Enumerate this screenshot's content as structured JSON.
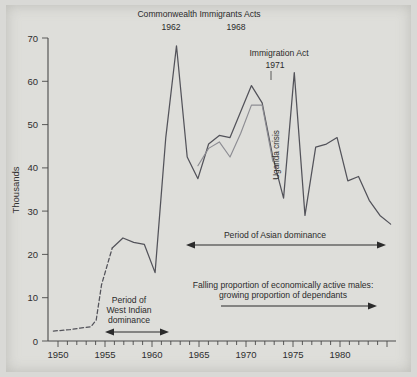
{
  "figure": {
    "background_color": "#dededa",
    "ink_color": "#4a4a4a",
    "secondary_series_color": "#8d8d93"
  },
  "chart_data": {
    "type": "line",
    "title": "",
    "xlabel": "",
    "ylabel": "Thousands",
    "xlim": [
      1949,
      1981.5
    ],
    "ylim": [
      0,
      70
    ],
    "ytick_step": 10,
    "xtick_step": 1,
    "xtick_label_step": 5,
    "grid": false,
    "legend": "none",
    "ytick_labels": [
      "0",
      "10",
      "20",
      "30",
      "40",
      "50",
      "60",
      "70"
    ],
    "ytick_values": [
      0,
      10,
      20,
      30,
      40,
      50,
      60,
      70
    ],
    "xtick_labels": [
      "1950",
      "1955",
      "1960",
      "1965",
      "1970",
      "1975",
      "1980"
    ],
    "xtick_values": [
      1950,
      1955,
      1960,
      1965,
      1970,
      1975,
      1980
    ],
    "series": [
      {
        "name": "Total immigration (New Commonwealth)",
        "style": "solid-with-dashed-lead",
        "color": "#53535a",
        "dashed_until_year": 1955,
        "x": [
          1949.5,
          1951,
          1952,
          1953,
          1953.5,
          1954,
          1955,
          1956,
          1957,
          1958,
          1959,
          1960,
          1961,
          1962,
          1963,
          1964,
          1965,
          1966,
          1967,
          1968,
          1969,
          1970,
          1971,
          1972,
          1973,
          1974,
          1975,
          1976,
          1977,
          1978,
          1979,
          1980,
          1981
        ],
        "y": [
          2.3,
          2.6,
          3.0,
          3.3,
          4.8,
          13.0,
          21.5,
          23.8,
          22.8,
          22.3,
          15.8,
          47.0,
          68.2,
          42.5,
          37.5,
          45.5,
          47.5,
          47.0,
          53.0,
          59.0,
          55.0,
          42.5,
          33.0,
          62.0,
          29.0,
          44.8,
          45.5,
          47.0,
          37.0,
          38.0,
          32.5,
          29.0,
          27.0
        ]
      },
      {
        "name": "Secondary (dependants) series",
        "style": "solid",
        "color": "#8d8d93",
        "x": [
          1963,
          1964,
          1965,
          1966,
          1967,
          1968,
          1969,
          1970
        ],
        "y": [
          40.5,
          44.5,
          46.0,
          42.5,
          48.0,
          54.5,
          54.5,
          41.5
        ]
      }
    ],
    "annotations": [
      {
        "name": "commonwealth-immigrants-acts",
        "text": "Commonwealth Immigrants Acts",
        "type": "label",
        "x": 1965.0,
        "y": 73.5
      },
      {
        "name": "act-year-1962",
        "text": "1962",
        "type": "label-with-leader",
        "x": 1962,
        "y": 70.5
      },
      {
        "name": "act-year-1968",
        "text": "1968",
        "type": "label-with-leader",
        "x": 1967.6,
        "y": 70.5
      },
      {
        "name": "immigration-act",
        "text": "Immigration Act",
        "type": "label",
        "x": 1971.4,
        "y": 67.0
      },
      {
        "name": "immigration-act-year",
        "text": "1971",
        "type": "label-with-leader",
        "x": 1971.2,
        "y": 64.0
      },
      {
        "name": "uganda-crisis",
        "text": "Uganda crisis",
        "type": "rotated-label",
        "rotation": -90,
        "x": 1972.1,
        "y": 44.0
      },
      {
        "name": "period-of-asian-dominance",
        "text": "Period of Asian dominance",
        "type": "double-arrow-span",
        "x_start": 1963.0,
        "x_end": 1981.0,
        "y": 23.5
      },
      {
        "name": "falling-proportion-line-1",
        "text": "Falling proportion of economically active males:",
        "type": "label",
        "x": 1971.5,
        "y": 14.8
      },
      {
        "name": "falling-proportion-line-2",
        "text": "growing proportion of dependants",
        "type": "label",
        "x": 1971.5,
        "y": 12.6
      },
      {
        "name": "falling-proportion-arrow",
        "text": "",
        "type": "single-arrow-span",
        "x_start": 1965.7,
        "x_end": 1980.5,
        "y": 10.2
      },
      {
        "name": "period-of-west-indian-dominance-1",
        "text": "Period of",
        "type": "label",
        "x": 1957.6,
        "y": 9.4
      },
      {
        "name": "period-of-west-indian-dominance-2",
        "text": "West Indian",
        "type": "label",
        "x": 1957.6,
        "y": 7.0
      },
      {
        "name": "period-of-west-indian-dominance-3",
        "text": "dominance",
        "type": "label",
        "x": 1957.6,
        "y": 4.6
      },
      {
        "name": "west-indian-dominance-arrow",
        "text": "",
        "type": "double-arrow-span",
        "x_start": 1955.0,
        "x_end": 1960.6,
        "y": 2.1
      }
    ]
  }
}
